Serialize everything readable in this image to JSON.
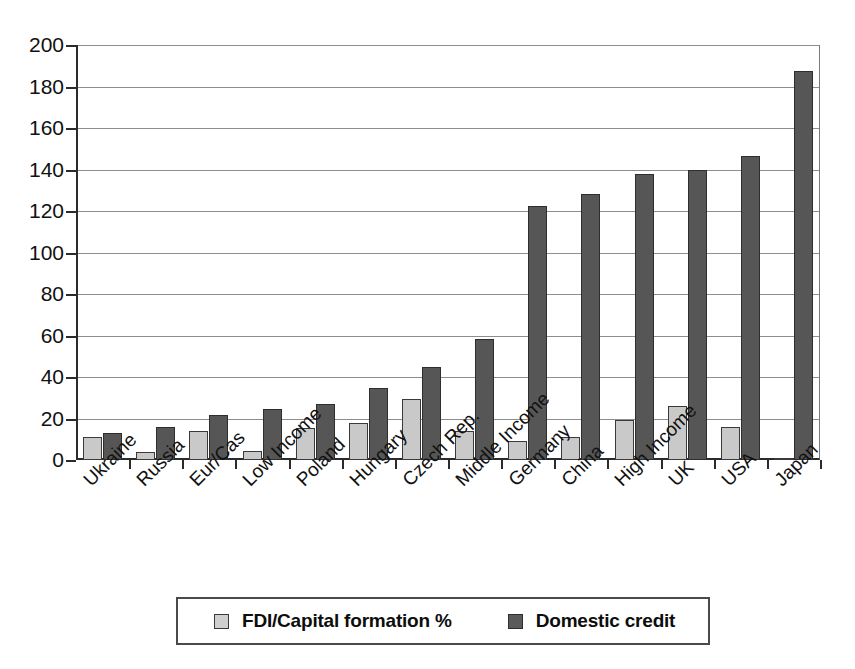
{
  "chart_data": {
    "type": "bar",
    "title": "",
    "subtitle": "",
    "xlabel": "",
    "ylabel": "",
    "ylim": [
      0,
      200
    ],
    "ytick_step": 20,
    "yticks": [
      "0",
      "20",
      "40",
      "60",
      "80",
      "100",
      "120",
      "140",
      "160",
      "180",
      "200"
    ],
    "grid": true,
    "legend_position": "bottom",
    "categories": [
      "Ukraine",
      "Russia",
      "Eur/Cas",
      "Low Income",
      "Poland",
      "Hungary",
      "Czech Rep.",
      "Middle Income",
      "Germany",
      "China",
      "High Income",
      "UK",
      "USA",
      "Japan"
    ],
    "series": [
      {
        "name": "FDI/Capital formation %",
        "color": "#c9c9c9",
        "values": [
          11,
          4,
          14,
          4.5,
          15.5,
          18,
          29.5,
          14,
          9,
          11,
          19.5,
          26,
          16,
          1
        ]
      },
      {
        "name": "Domestic credit",
        "color": "#565656",
        "values": [
          13,
          16,
          21.5,
          24.5,
          27,
          34.5,
          45,
          58.5,
          122.5,
          128,
          138,
          140,
          146.5,
          187.5
        ]
      }
    ]
  },
  "legend": {
    "entries": [
      {
        "label": "FDI/Capital formation %",
        "swatch": "light-gray-swatch"
      },
      {
        "label": "Domestic credit",
        "swatch": "dark-gray-swatch"
      }
    ]
  }
}
